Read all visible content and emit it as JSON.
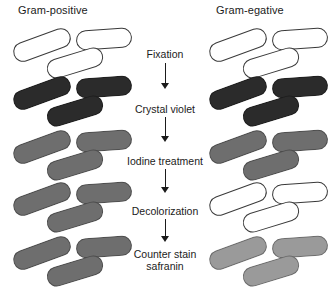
{
  "figure": {
    "width": 330,
    "height": 295,
    "background": "#ffffff"
  },
  "columns": {
    "left": {
      "header": "Gram-positive",
      "header_x": 18,
      "header_y": 4,
      "cluster_x": 10
    },
    "right": {
      "header": "Gram-egative",
      "header_x": 216,
      "header_y": 4,
      "cluster_x": 206
    }
  },
  "steps": [
    {
      "label": "Fixation",
      "y": 48
    },
    {
      "label": "Crystal violet",
      "y": 103
    },
    {
      "label": "Iodine treatment",
      "y": 155
    },
    {
      "label": "Decolorization",
      "y": 205
    },
    {
      "label": "Counter stain\nsafranin",
      "y": 248
    }
  ],
  "arrows": [
    {
      "y": 63,
      "height": 26
    },
    {
      "y": 117,
      "height": 25
    },
    {
      "y": 169,
      "height": 24
    },
    {
      "y": 219,
      "height": 23
    }
  ],
  "colors": {
    "unstained": "#ffffff",
    "crystal_violet": "#2b2b2b",
    "iodine": "#6e6e6e",
    "retained_stain": "#6e6e6e",
    "safranin": "#9a9a9a",
    "outline": "#3a3a3a",
    "text": "#1b1b1b"
  },
  "rows": [
    {
      "stage": "initial",
      "y": 26,
      "left": {
        "fill": "#ffffff",
        "state": "unstained"
      },
      "right": {
        "fill": "#ffffff",
        "state": "unstained"
      }
    },
    {
      "stage": "crystal-violet",
      "y": 74,
      "left": {
        "fill": "#2b2b2b",
        "state": "stained-dark"
      },
      "right": {
        "fill": "#2b2b2b",
        "state": "stained-dark"
      }
    },
    {
      "stage": "iodine-treatment",
      "y": 128,
      "left": {
        "fill": "#6e6e6e",
        "state": "stained-medium"
      },
      "right": {
        "fill": "#6e6e6e",
        "state": "stained-medium"
      }
    },
    {
      "stage": "decolorization",
      "y": 180,
      "left": {
        "fill": "#6e6e6e",
        "state": "stain-retained"
      },
      "right": {
        "fill": "#ffffff",
        "state": "decolorized"
      }
    },
    {
      "stage": "counter-stain-safranin",
      "y": 234,
      "left": {
        "fill": "#6e6e6e",
        "state": "stain-retained"
      },
      "right": {
        "fill": "#9a9a9a",
        "state": "safranin-stained"
      }
    }
  ]
}
